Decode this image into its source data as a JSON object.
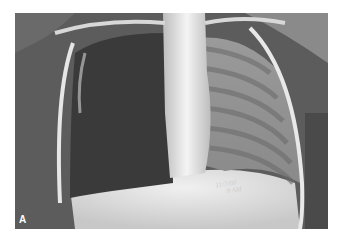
{
  "figure": {
    "panel_label": "A",
    "annotation_line1": "11/7/00",
    "annotation_line2": "9 AM"
  },
  "colors": {
    "background": "#ffffff",
    "soft_tissue": "#5a5a5a",
    "lung_dark": "#3a3a3a",
    "bone_bright": "#f2f2f2"
  }
}
